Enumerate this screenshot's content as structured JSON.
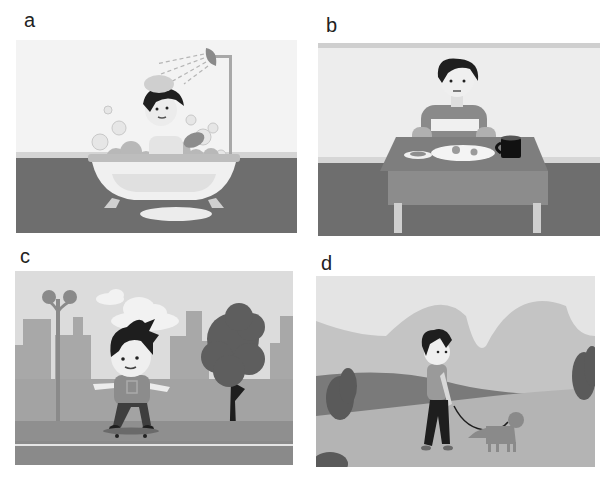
{
  "panels": [
    {
      "id": "a",
      "label": "a",
      "scene": "boy-bathing-in-bathtub",
      "elements": [
        "shower-head",
        "water-spray",
        "soap-bubbles",
        "bathtub",
        "sponge",
        "bath-mat"
      ]
    },
    {
      "id": "b",
      "label": "b",
      "scene": "boy-eating-breakfast-at-table",
      "elements": [
        "striped-shirt",
        "table",
        "plate-with-food",
        "small-plate",
        "coffee-mug"
      ]
    },
    {
      "id": "c",
      "label": "c",
      "scene": "boy-skateboarding-in-city",
      "elements": [
        "street-lamp",
        "clouds",
        "city-buildings",
        "tree",
        "skateboard",
        "road"
      ]
    },
    {
      "id": "d",
      "label": "d",
      "scene": "boy-walking-dog",
      "elements": [
        "hills",
        "bushes",
        "dog",
        "leash"
      ]
    }
  ],
  "colors": {
    "background": "#ffffff",
    "floor_dark": "#6b6b6b",
    "wall_light": "#ececec",
    "mid_gray": "#9a9a9a",
    "hair": "#1e1e1e"
  }
}
